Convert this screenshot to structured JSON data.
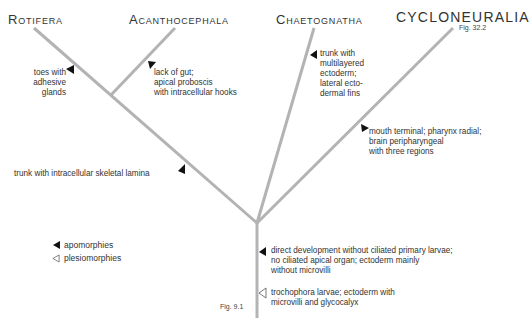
{
  "taxa": {
    "rotifera": "Rotifera",
    "acanthocephala": "Acanthocephala",
    "chaetognatha": "Chaetognatha",
    "cycloneuralia": "CYCLONEURALIA",
    "cycloneuralia_ref": "Fig. 32.2"
  },
  "characters": {
    "rotifera": [
      "toes with",
      "adhesive",
      "glands"
    ],
    "acanthocephala": [
      "lack of gut;",
      "apical proboscis",
      "with intracellular hooks"
    ],
    "chaetognatha": [
      "trunk with",
      "multilayered",
      "ectoderm;",
      "lateral ecto-",
      "dermal fins"
    ],
    "cycloneuralia": [
      "mouth terminal; pharynx radial;",
      "brain peripharyngeal",
      "with three regions"
    ],
    "rotifera_acanthocephala": [
      "trunk with intracellular skeletal lamina"
    ],
    "stem_apomorphies": [
      "direct development without ciliated primary larvae;",
      "no ciliated apical organ; ectoderm mainly",
      "without microvilli"
    ],
    "stem_plesiomorphies": [
      "trochophora larvae; ectoderm with",
      "microvilli and glycocalyx"
    ]
  },
  "legend": {
    "apomorphies": "apomorphies",
    "plesiomorphies": "plesiomorphies"
  },
  "stem_ref": "Fig. 9.1",
  "colors": {
    "branch": "#b3b3b3",
    "marker": "#111111",
    "text": "#333333"
  }
}
